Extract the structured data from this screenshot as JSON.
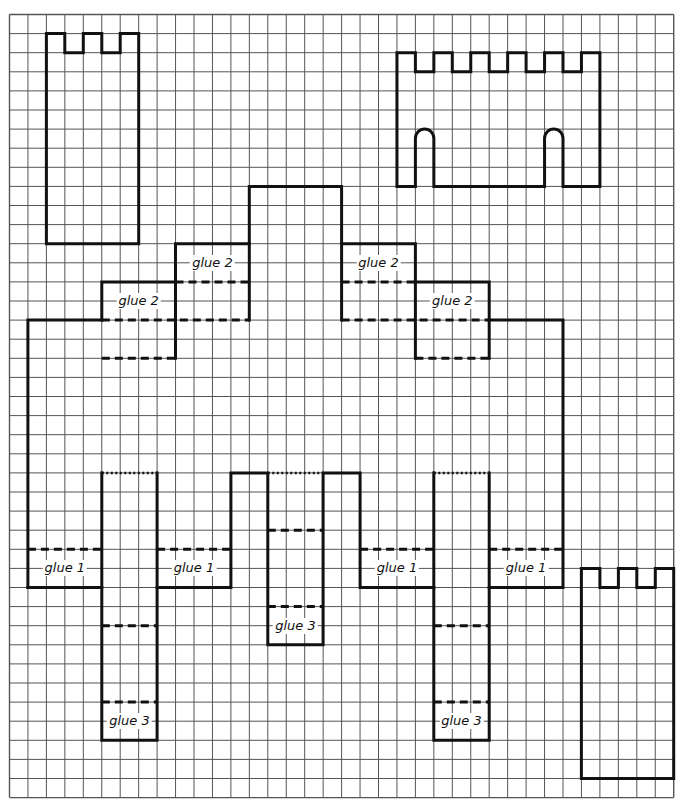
{
  "grid": {
    "origin_x": 9.5,
    "origin_y": 14.5,
    "cell_w": 18.45,
    "cell_h": 19.1,
    "cols": 36,
    "rows": 41,
    "line_color": "#555555",
    "outline_color": "#111111"
  },
  "pieces": [
    {
      "name": "tower-top-left",
      "outline": [
        [
          2,
          1
        ],
        [
          3,
          1
        ],
        [
          3,
          2
        ],
        [
          4,
          2
        ],
        [
          4,
          1
        ],
        [
          5,
          1
        ],
        [
          5,
          2
        ],
        [
          6,
          2
        ],
        [
          6,
          1
        ],
        [
          7,
          1
        ],
        [
          7,
          12
        ],
        [
          2,
          12
        ]
      ]
    },
    {
      "name": "tower-bottom-right",
      "outline": [
        [
          31,
          29
        ],
        [
          32,
          29
        ],
        [
          32,
          30
        ],
        [
          33,
          30
        ],
        [
          33,
          29
        ],
        [
          34,
          29
        ],
        [
          34,
          30
        ],
        [
          35,
          30
        ],
        [
          35,
          29
        ],
        [
          36,
          29
        ],
        [
          36,
          40
        ],
        [
          31,
          40
        ]
      ]
    }
  ],
  "castle_wall": {
    "name": "castle-wall-top-right",
    "left": 21,
    "right": 32,
    "top": 2,
    "crenel_bottom": 3,
    "bottom": 9,
    "crenels": [
      [
        22,
        23
      ],
      [
        24,
        25
      ],
      [
        26,
        27
      ],
      [
        28,
        29
      ],
      [
        30,
        31
      ]
    ],
    "arches": [
      [
        22,
        23,
        6
      ],
      [
        29,
        30,
        6
      ]
    ]
  },
  "main_piece": {
    "name": "castle-base-net",
    "solid_segments": [
      [
        [
          1,
          30
        ],
        [
          1,
          16
        ],
        [
          5,
          16
        ]
      ],
      [
        [
          5,
          16
        ],
        [
          5,
          14
        ],
        [
          9,
          14
        ],
        [
          9,
          18
        ]
      ],
      [
        [
          9,
          14
        ],
        [
          9,
          12
        ],
        [
          13,
          12
        ],
        [
          13,
          9
        ],
        [
          18,
          9
        ],
        [
          18,
          16
        ]
      ],
      [
        [
          13,
          12
        ],
        [
          13,
          16
        ]
      ],
      [
        [
          18,
          12
        ],
        [
          22,
          12
        ],
        [
          22,
          14
        ],
        [
          26,
          14
        ],
        [
          26,
          18
        ]
      ],
      [
        [
          22,
          14
        ],
        [
          22,
          18
        ]
      ],
      [
        [
          26,
          16
        ],
        [
          30,
          16
        ],
        [
          30,
          30
        ],
        [
          26,
          30
        ],
        [
          26,
          24
        ]
      ],
      [
        [
          1,
          30
        ],
        [
          5,
          30
        ],
        [
          5,
          38
        ],
        [
          8,
          38
        ],
        [
          8,
          24
        ]
      ],
      [
        [
          5,
          24
        ],
        [
          5,
          30
        ]
      ],
      [
        [
          8,
          30
        ],
        [
          12,
          30
        ],
        [
          12,
          24
        ],
        [
          14,
          24
        ],
        [
          14,
          33
        ],
        [
          17,
          33
        ],
        [
          17,
          24
        ],
        [
          19,
          24
        ],
        [
          19,
          30
        ],
        [
          23,
          30
        ],
        [
          23,
          38
        ],
        [
          26,
          38
        ],
        [
          26,
          30
        ]
      ],
      [
        [
          23,
          24
        ],
        [
          23,
          30
        ]
      ]
    ],
    "dashed_segments": [
      [
        [
          5,
          16
        ],
        [
          13,
          16
        ]
      ],
      [
        [
          9,
          14
        ],
        [
          13,
          14
        ]
      ],
      [
        [
          5,
          18
        ],
        [
          9,
          18
        ]
      ],
      [
        [
          18,
          14
        ],
        [
          22,
          14
        ]
      ],
      [
        [
          18,
          16
        ],
        [
          26,
          16
        ]
      ],
      [
        [
          22,
          18
        ],
        [
          26,
          18
        ]
      ],
      [
        [
          1,
          28
        ],
        [
          5,
          28
        ]
      ],
      [
        [
          8,
          28
        ],
        [
          12,
          28
        ]
      ],
      [
        [
          19,
          28
        ],
        [
          23,
          28
        ]
      ],
      [
        [
          26,
          28
        ],
        [
          30,
          28
        ]
      ],
      [
        [
          5,
          32
        ],
        [
          8,
          32
        ]
      ],
      [
        [
          5,
          36
        ],
        [
          8,
          36
        ]
      ],
      [
        [
          14,
          27
        ],
        [
          17,
          27
        ]
      ],
      [
        [
          14,
          31
        ],
        [
          17,
          31
        ]
      ],
      [
        [
          23,
          32
        ],
        [
          26,
          32
        ]
      ],
      [
        [
          23,
          36
        ],
        [
          26,
          36
        ]
      ]
    ],
    "dotted_segments": [
      [
        [
          5,
          24
        ],
        [
          8,
          24
        ]
      ],
      [
        [
          14,
          24
        ],
        [
          17,
          24
        ]
      ],
      [
        [
          23,
          24
        ],
        [
          26,
          24
        ]
      ]
    ]
  },
  "labels": [
    {
      "text": "glue 2",
      "col": 7,
      "row": 15
    },
    {
      "text": "glue 2",
      "col": 11,
      "row": 13
    },
    {
      "text": "glue 2",
      "col": 20,
      "row": 13
    },
    {
      "text": "glue 2",
      "col": 24,
      "row": 15
    },
    {
      "text": "glue 1",
      "col": 3,
      "row": 29
    },
    {
      "text": "glue 1",
      "col": 10,
      "row": 29
    },
    {
      "text": "glue 1",
      "col": 21,
      "row": 29
    },
    {
      "text": "glue 1",
      "col": 28,
      "row": 29
    },
    {
      "text": "glue 3",
      "col": 15.5,
      "row": 32
    },
    {
      "text": "glue 3",
      "col": 6.5,
      "row": 37
    },
    {
      "text": "glue 3",
      "col": 24.5,
      "row": 37
    }
  ]
}
